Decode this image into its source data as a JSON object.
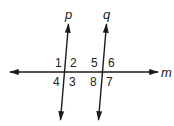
{
  "diagram": {
    "type": "parallel-lines-cut-by-transversal",
    "lines": {
      "p": {
        "label": "p"
      },
      "q": {
        "label": "q"
      },
      "m": {
        "label": "m"
      }
    },
    "angles": {
      "a1": "1",
      "a2": "2",
      "a3": "3",
      "a4": "4",
      "a5": "5",
      "a6": "6",
      "a7": "7",
      "a8": "8"
    },
    "colors": {
      "stroke": "#1a1a1a",
      "background": "#ffffff"
    }
  }
}
